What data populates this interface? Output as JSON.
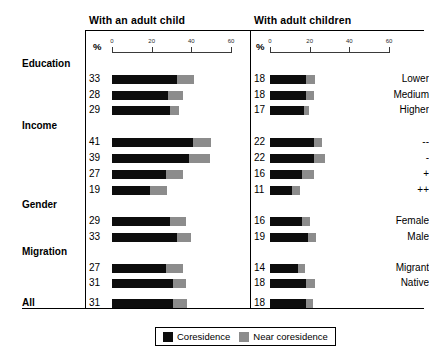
{
  "chart_data": {
    "type": "bar",
    "title": "",
    "subtitle": "",
    "orientation": "horizontal",
    "stacked": true,
    "xlabel": "%",
    "ylabel": "",
    "xlim": [
      0,
      60
    ],
    "xticks": [
      0,
      20,
      40,
      60
    ],
    "xtick_labels": [
      "0",
      "20",
      "40",
      "60"
    ],
    "grid": false,
    "legend_position": "bottom-center",
    "legend": [
      "Coresidence",
      "Near coresidence"
    ],
    "series_colors": [
      "#0d0d0d",
      "#8c8c8c"
    ],
    "panels": [
      {
        "title": "With an adult child",
        "pct_symbol": "%"
      },
      {
        "title": "With adult children",
        "pct_symbol": "%"
      }
    ],
    "categories": [
      "Lower",
      "Medium",
      "Higher",
      "--",
      "-",
      "+",
      "++",
      "Female",
      "Male",
      "Migrant",
      "Native",
      "All"
    ],
    "groups": [
      {
        "label": "Education",
        "members": [
          "Lower",
          "Medium",
          "Higher"
        ]
      },
      {
        "label": "Income",
        "members": [
          "--",
          "-",
          "+",
          "++"
        ]
      },
      {
        "label": "Gender",
        "members": [
          "Female",
          "Male"
        ]
      },
      {
        "label": "Migration",
        "members": [
          "Migrant",
          "Native"
        ]
      },
      {
        "label": "All",
        "members": [
          "All"
        ]
      }
    ],
    "panel_data": [
      {
        "panel": "With an adult child",
        "series": [
          {
            "name": "Coresidence",
            "values": [
              33,
              28,
              29,
              41,
              39,
              27,
              19,
              29,
              33,
              27,
              31,
              31
            ]
          },
          {
            "name": "Near coresidence",
            "values": [
              8.5,
              8,
              5,
              9,
              10.5,
              9,
              8.5,
              8.5,
              7,
              9,
              6.5,
              7
            ]
          }
        ],
        "value_labels": [
          "33",
          "28",
          "29",
          "41",
          "39",
          "27",
          "19",
          "29",
          "33",
          "27",
          "31",
          "31"
        ]
      },
      {
        "panel": "With adult children",
        "series": [
          {
            "name": "Coresidence",
            "values": [
              18,
              18,
              17,
              22,
              22,
              16,
              11,
              16,
              19,
              14,
              18,
              18
            ]
          },
          {
            "name": "Near coresidence",
            "values": [
              4.5,
              4,
              2.5,
              4,
              5.5,
              6,
              4,
              4,
              4,
              3.5,
              4.5,
              3.5
            ]
          }
        ],
        "value_labels": [
          "18",
          "18",
          "17",
          "22",
          "22",
          "16",
          "11",
          "16",
          "19",
          "14",
          "18",
          "18"
        ]
      }
    ]
  },
  "rows": [
    {
      "kind": "group",
      "label": "Education"
    },
    {
      "kind": "data",
      "label": "Lower",
      "left_value": "33",
      "right_value": "18",
      "left_core": 33,
      "left_near": 8.5,
      "right_core": 18,
      "right_near": 4.5
    },
    {
      "kind": "data",
      "label": "Medium",
      "left_value": "28",
      "right_value": "18",
      "left_core": 28,
      "left_near": 8.0,
      "right_core": 18,
      "right_near": 4.0
    },
    {
      "kind": "data",
      "label": "Higher",
      "left_value": "29",
      "right_value": "17",
      "left_core": 29,
      "left_near": 5.0,
      "right_core": 17,
      "right_near": 2.5
    },
    {
      "kind": "group",
      "label": "Income"
    },
    {
      "kind": "data",
      "label": "--",
      "left_value": "41",
      "right_value": "22",
      "left_core": 41,
      "left_near": 9.0,
      "right_core": 22,
      "right_near": 4.0
    },
    {
      "kind": "data",
      "label": "-",
      "left_value": "39",
      "right_value": "22",
      "left_core": 39,
      "left_near": 10.5,
      "right_core": 22,
      "right_near": 5.5
    },
    {
      "kind": "data",
      "label": "+",
      "left_value": "27",
      "right_value": "16",
      "left_core": 27,
      "left_near": 9.0,
      "right_core": 16,
      "right_near": 6.0
    },
    {
      "kind": "data",
      "label": "++",
      "left_value": "19",
      "right_value": "11",
      "left_core": 19,
      "left_near": 8.5,
      "right_core": 11,
      "right_near": 4.0
    },
    {
      "kind": "group",
      "label": "Gender"
    },
    {
      "kind": "data",
      "label": "Female",
      "left_value": "29",
      "right_value": "16",
      "left_core": 29,
      "left_near": 8.5,
      "right_core": 16,
      "right_near": 4.0
    },
    {
      "kind": "data",
      "label": "Male",
      "left_value": "33",
      "right_value": "19",
      "left_core": 33,
      "left_near": 7.0,
      "right_core": 19,
      "right_near": 4.0
    },
    {
      "kind": "group",
      "label": "Migration"
    },
    {
      "kind": "data",
      "label": "Migrant",
      "left_value": "27",
      "right_value": "14",
      "left_core": 27,
      "left_near": 9.0,
      "right_core": 14,
      "right_near": 3.5
    },
    {
      "kind": "data",
      "label": "Native",
      "left_value": "31",
      "right_value": "18",
      "left_core": 31,
      "left_near": 6.5,
      "right_core": 18,
      "right_near": 4.5
    },
    {
      "kind": "total",
      "label": "All",
      "left_value": "31",
      "right_value": "18",
      "left_core": 31,
      "left_near": 7.0,
      "right_core": 18,
      "right_near": 3.5
    }
  ],
  "legend": {
    "items": [
      {
        "label": "Coresidence",
        "color": "#0d0d0d"
      },
      {
        "label": "Near coresidence",
        "color": "#8c8c8c"
      }
    ]
  }
}
